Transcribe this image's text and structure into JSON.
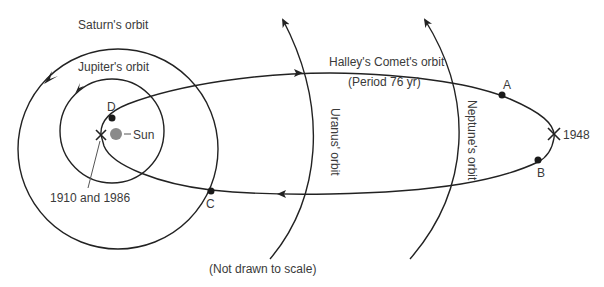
{
  "diagram": {
    "labels": {
      "saturn_orbit": "Saturn's orbit",
      "jupiter_orbit": "Jupiter's orbit",
      "sun": "Sun",
      "comet_orbit": "Halley's Comet's orbit",
      "period": "(Period 76 yr)",
      "uranus_orbit": "Uranus' orbit",
      "neptune_orbit": "Neptune's orbit",
      "perihelion_years": "1910 and 1986",
      "aphelion_year": "1948",
      "footnote": "(Not drawn to scale)"
    },
    "points": [
      {
        "id": "A",
        "label": "A"
      },
      {
        "id": "B",
        "label": "B"
      },
      {
        "id": "C",
        "label": "C"
      },
      {
        "id": "D",
        "label": "D"
      }
    ],
    "colors": {
      "line": "#222222",
      "text": "#3a3a3a",
      "sun": "#8a8a8a"
    }
  }
}
